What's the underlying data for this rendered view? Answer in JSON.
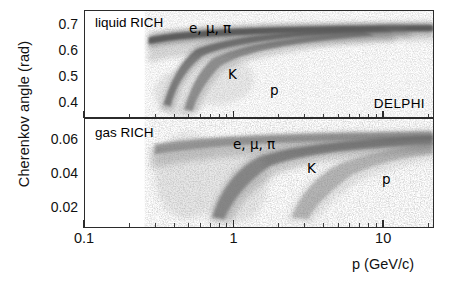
{
  "figure": {
    "ylabel": "Cherenkov angle (rad)",
    "xlabel": "p (GeV/c)",
    "experiment": "DELPHI"
  },
  "panels": [
    {
      "id": "liquid",
      "title": "liquid RICH",
      "yticks": [
        "0.7",
        "0.6",
        "0.5",
        "0.4"
      ],
      "annotations": [
        {
          "text": "e, μ, π",
          "name": "band-label-lepton-pion"
        },
        {
          "text": "K",
          "name": "band-label-kaon"
        },
        {
          "text": "p",
          "name": "band-label-proton"
        }
      ]
    },
    {
      "id": "gas",
      "title": "gas RICH",
      "yticks": [
        "0.06",
        "0.04",
        "0.02"
      ],
      "annotations": [
        {
          "text": "e, μ, π",
          "name": "band-label-lepton-pion"
        },
        {
          "text": "K",
          "name": "band-label-kaon"
        },
        {
          "text": "p",
          "name": "band-label-proton"
        }
      ]
    }
  ],
  "xticks": [
    "0.1",
    "1",
    "10"
  ],
  "chart_data": {
    "type": "scatter",
    "title": "",
    "subtitle": "",
    "xlabel": "p (GeV/c)",
    "ylabel": "Cherenkov angle (rad)",
    "xscale": "log",
    "xlim": [
      0.1,
      30
    ],
    "grid": false,
    "legend": "none",
    "annotations": [
      {
        "text": "liquid RICH",
        "panel": "liquid",
        "x": 0.13,
        "y": 0.735
      },
      {
        "text": "e, μ, π",
        "panel": "liquid",
        "x": 0.85,
        "y": 0.72
      },
      {
        "text": "K",
        "panel": "liquid",
        "x": 1.25,
        "y": 0.52
      },
      {
        "text": "p",
        "panel": "liquid",
        "x": 1.95,
        "y": 0.44
      },
      {
        "text": "DELPHI",
        "panel": "liquid",
        "x": 13.0,
        "y": 0.4
      },
      {
        "text": "gas RICH",
        "panel": "gas",
        "x": 0.13,
        "y": 0.062
      },
      {
        "text": "e, μ, π",
        "panel": "gas",
        "x": 1.1,
        "y": 0.064
      },
      {
        "text": "K",
        "panel": "gas",
        "x": 3.0,
        "y": 0.047
      },
      {
        "text": "p",
        "panel": "gas",
        "x": 11.0,
        "y": 0.042
      }
    ],
    "panels": [
      {
        "id": "liquid",
        "name": "liquid RICH",
        "ylim": [
          0.34,
          0.755
        ],
        "ytick_values": [
          0.4,
          0.5,
          0.6,
          0.7
        ],
        "ytick_labels": [
          "0.4",
          "0.5",
          "0.6",
          "0.7"
        ],
        "saturation_angle": 0.68,
        "series": [
          {
            "name": "e, μ, π",
            "particle_mass_GeV": 0.139,
            "x": [
              0.7,
              0.8,
              0.9,
              1.0,
              1.2,
              1.5,
              2.0,
              3.0,
              5.0,
              8.0,
              12.0,
              20.0,
              30.0
            ],
            "y": [
              0.66,
              0.666,
              0.669,
              0.671,
              0.674,
              0.676,
              0.678,
              0.679,
              0.68,
              0.68,
              0.68,
              0.68,
              0.68
            ]
          },
          {
            "name": "K",
            "particle_mass_GeV": 0.494,
            "x": [
              0.9,
              1.0,
              1.2,
              1.5,
              2.0,
              2.5,
              3.0,
              4.0,
              5.0,
              7.0,
              10.0,
              15.0,
              25.0
            ],
            "y": [
              0.39,
              0.455,
              0.536,
              0.59,
              0.628,
              0.645,
              0.654,
              0.664,
              0.669,
              0.674,
              0.677,
              0.679,
              0.68
            ]
          },
          {
            "name": "p",
            "particle_mass_GeV": 0.938,
            "x": [
              1.55,
              1.7,
              2.0,
              2.5,
              3.0,
              4.0,
              5.0,
              7.0,
              10.0,
              15.0,
              25.0
            ],
            "y": [
              0.38,
              0.43,
              0.5,
              0.566,
              0.602,
              0.638,
              0.654,
              0.667,
              0.673,
              0.677,
              0.679
            ]
          }
        ]
      },
      {
        "id": "gas",
        "name": "gas RICH",
        "ylim": [
          0.008,
          0.072
        ],
        "ytick_values": [
          0.02,
          0.04,
          0.06
        ],
        "ytick_labels": [
          "0.02",
          "0.04",
          "0.06"
        ],
        "saturation_angle": 0.063,
        "series": [
          {
            "name": "e, μ, π",
            "particle_mass_GeV": 0.139,
            "x": [
              0.7,
              1.0,
              1.5,
              2.0,
              3.0,
              5.0,
              8.0,
              12.0,
              20.0,
              30.0
            ],
            "y": [
              0.05,
              0.057,
              0.06,
              0.0615,
              0.0625,
              0.0628,
              0.063,
              0.063,
              0.063,
              0.063
            ]
          },
          {
            "name": "K",
            "particle_mass_GeV": 0.494,
            "x": [
              1.9,
              2.2,
              2.6,
              3.0,
              3.5,
              4.5,
              6.0,
              8.0,
              12.0,
              18.0,
              30.0
            ],
            "y": [
              0.014,
              0.026,
              0.035,
              0.04,
              0.045,
              0.051,
              0.056,
              0.059,
              0.061,
              0.062,
              0.0628
            ]
          },
          {
            "name": "p",
            "particle_mass_GeV": 0.938,
            "x": [
              4.0,
              5.0,
              6.0,
              8.0,
              10.0,
              14.0,
              20.0,
              30.0
            ],
            "y": [
              0.013,
              0.024,
              0.031,
              0.04,
              0.046,
              0.053,
              0.057,
              0.06
            ]
          }
        ]
      }
    ]
  }
}
